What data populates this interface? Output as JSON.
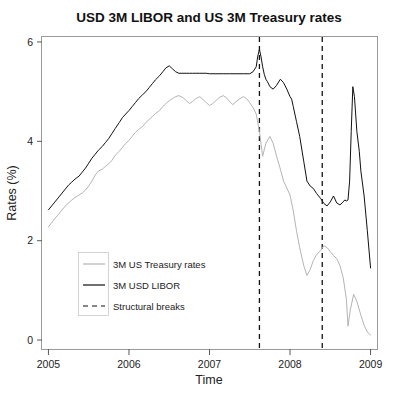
{
  "chart_data": {
    "type": "line",
    "title": "USD 3M LIBOR and US 3M Treasury rates",
    "xlabel": "Time",
    "ylabel": "Rates (%)",
    "xlim": [
      2004.92,
      2009.08
    ],
    "ylim": [
      -0.18,
      6.1
    ],
    "grid": false,
    "xticks": [
      2005,
      2006,
      2007,
      2008,
      2009
    ],
    "xtick_labels": [
      "2005",
      "2006",
      "2007",
      "2008",
      "2009"
    ],
    "yticks": [
      0,
      2,
      4,
      6
    ],
    "ytick_labels": [
      "0",
      "2",
      "4",
      "6"
    ],
    "legend_position": "lower-left",
    "colors": {
      "treasury": "#b4b4b4",
      "libor": "#111111",
      "breaks": "#111111",
      "panel_border": "#9a9a9a",
      "background": "#ffffff"
    },
    "annotations": {
      "structural_breaks": [
        2007.62,
        2008.4
      ]
    },
    "series": [
      {
        "name": "3M US Treasury rates",
        "color": "#b4b4b4",
        "style": "solid",
        "x": [
          2005.0,
          2005.04,
          2005.08,
          2005.12,
          2005.17,
          2005.21,
          2005.25,
          2005.29,
          2005.33,
          2005.38,
          2005.42,
          2005.46,
          2005.5,
          2005.54,
          2005.58,
          2005.62,
          2005.67,
          2005.71,
          2005.75,
          2005.79,
          2005.83,
          2005.88,
          2005.92,
          2005.96,
          2006.0,
          2006.04,
          2006.08,
          2006.12,
          2006.17,
          2006.21,
          2006.25,
          2006.29,
          2006.33,
          2006.38,
          2006.42,
          2006.46,
          2006.5,
          2006.54,
          2006.58,
          2006.62,
          2006.67,
          2006.71,
          2006.75,
          2006.79,
          2006.83,
          2006.88,
          2006.92,
          2006.96,
          2007.0,
          2007.04,
          2007.08,
          2007.12,
          2007.17,
          2007.21,
          2007.25,
          2007.29,
          2007.33,
          2007.38,
          2007.42,
          2007.46,
          2007.5,
          2007.54,
          2007.58,
          2007.62,
          2007.66,
          2007.7,
          2007.75,
          2007.79,
          2007.83,
          2007.88,
          2007.92,
          2007.96,
          2008.0,
          2008.04,
          2008.08,
          2008.12,
          2008.17,
          2008.21,
          2008.25,
          2008.29,
          2008.33,
          2008.38,
          2008.42,
          2008.46,
          2008.5,
          2008.54,
          2008.58,
          2008.62,
          2008.66,
          2008.7,
          2008.72,
          2008.75,
          2008.79,
          2008.83,
          2008.88,
          2008.92,
          2008.96,
          2009.0
        ],
        "y": [
          2.28,
          2.36,
          2.45,
          2.52,
          2.62,
          2.7,
          2.76,
          2.82,
          2.87,
          2.92,
          2.96,
          3.02,
          3.1,
          3.2,
          3.32,
          3.4,
          3.44,
          3.5,
          3.55,
          3.62,
          3.72,
          3.8,
          3.88,
          3.96,
          4.02,
          4.1,
          4.18,
          4.24,
          4.3,
          4.38,
          4.44,
          4.5,
          4.56,
          4.62,
          4.7,
          4.76,
          4.82,
          4.86,
          4.9,
          4.92,
          4.88,
          4.82,
          4.76,
          4.8,
          4.86,
          4.9,
          4.84,
          4.78,
          4.72,
          4.76,
          4.82,
          4.88,
          4.92,
          4.88,
          4.8,
          4.74,
          4.8,
          4.86,
          4.9,
          4.86,
          4.78,
          4.68,
          4.55,
          4.2,
          3.7,
          3.96,
          4.1,
          3.96,
          3.72,
          3.44,
          3.2,
          3.06,
          2.92,
          2.6,
          2.2,
          1.86,
          1.5,
          1.3,
          1.42,
          1.6,
          1.72,
          1.8,
          1.9,
          1.86,
          1.78,
          1.7,
          1.64,
          1.5,
          1.26,
          0.82,
          0.28,
          0.62,
          0.92,
          0.78,
          0.5,
          0.3,
          0.16,
          0.1
        ]
      },
      {
        "name": "3M USD LIBOR",
        "color": "#111111",
        "style": "solid",
        "x": [
          2005.0,
          2005.04,
          2005.08,
          2005.12,
          2005.17,
          2005.21,
          2005.25,
          2005.29,
          2005.33,
          2005.38,
          2005.42,
          2005.46,
          2005.5,
          2005.54,
          2005.58,
          2005.62,
          2005.67,
          2005.71,
          2005.75,
          2005.79,
          2005.83,
          2005.88,
          2005.92,
          2005.96,
          2006.0,
          2006.04,
          2006.08,
          2006.12,
          2006.17,
          2006.21,
          2006.25,
          2006.29,
          2006.33,
          2006.38,
          2006.42,
          2006.46,
          2006.5,
          2006.54,
          2006.58,
          2006.62,
          2006.67,
          2006.71,
          2006.75,
          2006.79,
          2006.83,
          2006.88,
          2006.92,
          2006.96,
          2007.0,
          2007.08,
          2007.17,
          2007.25,
          2007.33,
          2007.42,
          2007.5,
          2007.54,
          2007.58,
          2007.6,
          2007.62,
          2007.64,
          2007.66,
          2007.68,
          2007.7,
          2007.72,
          2007.75,
          2007.79,
          2007.83,
          2007.88,
          2007.92,
          2007.96,
          2008.0,
          2008.02,
          2008.04,
          2008.08,
          2008.12,
          2008.17,
          2008.21,
          2008.25,
          2008.29,
          2008.33,
          2008.38,
          2008.42,
          2008.46,
          2008.5,
          2008.54,
          2008.58,
          2008.62,
          2008.66,
          2008.68,
          2008.7,
          2008.72,
          2008.74,
          2008.76,
          2008.78,
          2008.8,
          2008.83,
          2008.86,
          2008.88,
          2008.92,
          2008.96,
          2009.0
        ],
        "y": [
          2.62,
          2.7,
          2.78,
          2.86,
          2.96,
          3.04,
          3.12,
          3.18,
          3.24,
          3.3,
          3.38,
          3.46,
          3.56,
          3.66,
          3.74,
          3.82,
          3.9,
          3.98,
          4.06,
          4.16,
          4.26,
          4.38,
          4.48,
          4.55,
          4.62,
          4.7,
          4.78,
          4.86,
          4.94,
          5.0,
          5.08,
          5.16,
          5.24,
          5.32,
          5.4,
          5.48,
          5.52,
          5.46,
          5.4,
          5.37,
          5.37,
          5.37,
          5.37,
          5.37,
          5.37,
          5.37,
          5.37,
          5.37,
          5.36,
          5.36,
          5.36,
          5.36,
          5.36,
          5.36,
          5.36,
          5.4,
          5.5,
          5.72,
          5.85,
          5.7,
          5.5,
          5.35,
          5.25,
          5.2,
          5.1,
          5.05,
          5.12,
          5.25,
          5.18,
          5.05,
          4.9,
          4.85,
          4.7,
          4.4,
          4.1,
          3.6,
          3.2,
          3.1,
          3.05,
          2.95,
          2.85,
          2.75,
          2.7,
          2.78,
          2.9,
          2.76,
          2.72,
          2.78,
          2.82,
          2.8,
          2.82,
          3.2,
          4.2,
          5.1,
          4.9,
          4.2,
          3.8,
          3.4,
          2.9,
          2.2,
          1.45
        ]
      }
    ],
    "legend_entries": [
      {
        "label": "3M US Treasury rates",
        "color": "#b4b4b4",
        "style": "solid"
      },
      {
        "label": "3M USD LIBOR",
        "color": "#111111",
        "style": "solid"
      },
      {
        "label": "Structural breaks",
        "color": "#111111",
        "style": "dashed"
      }
    ]
  }
}
